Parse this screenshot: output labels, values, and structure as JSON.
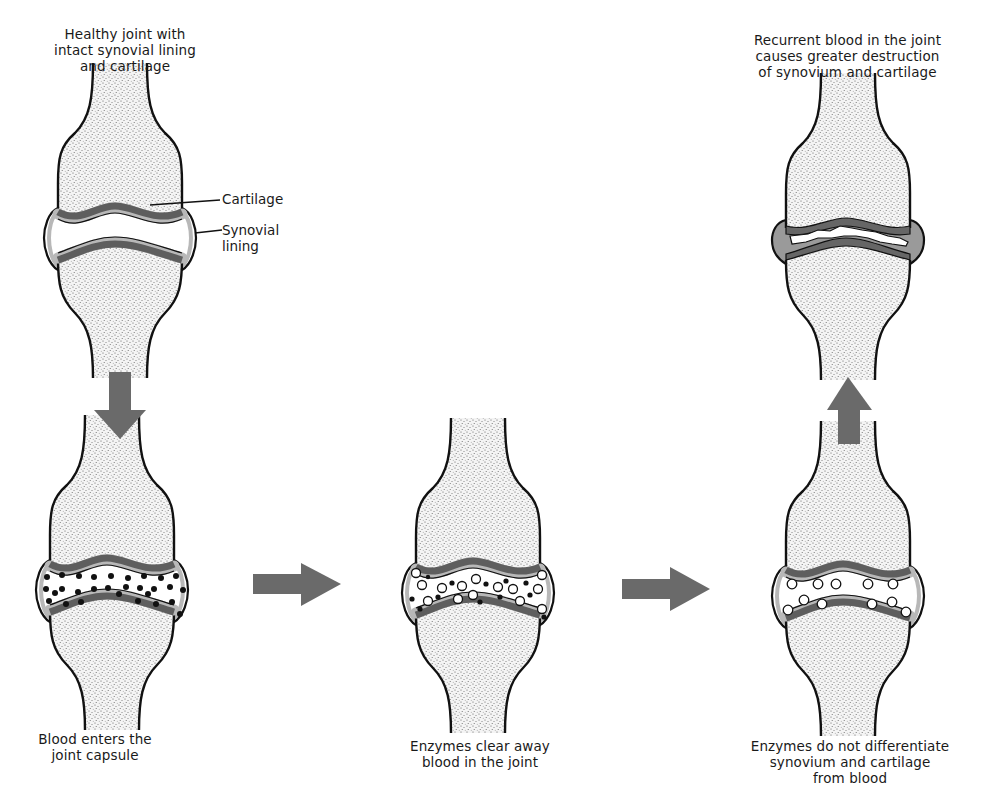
{
  "colors": {
    "bone_outline": "#111111",
    "bone_fill": "#f2f2f2",
    "stipple": "#555555",
    "cartilage": "#6e6e6e",
    "synovial": "#b8b8b8",
    "arrow": "#6a6a6a",
    "blood": "#111111"
  },
  "panels": [
    {
      "id": "healthy",
      "caption_lines": [
        "Healthy joint with",
        "intact synovial lining",
        "and cartilage"
      ],
      "labels": [
        {
          "text": "Cartilage"
        },
        {
          "lines": [
            "Synovial",
            "lining"
          ]
        }
      ]
    },
    {
      "id": "blood-enters",
      "caption_lines": [
        "Blood enters the",
        "joint capsule"
      ]
    },
    {
      "id": "enzymes-clear",
      "caption_lines": [
        "Enzymes clear away",
        "blood in the joint"
      ]
    },
    {
      "id": "enzymes-no-differentiate",
      "caption_lines": [
        "Enzymes do not differentiate",
        "synovium and cartilage",
        "from blood"
      ]
    },
    {
      "id": "recurrent",
      "caption_lines": [
        "Recurrent blood in the joint",
        "causes greater destruction",
        "of synovium and cartilage"
      ]
    }
  ],
  "arrows": [
    {
      "from": "healthy",
      "to": "blood-enters",
      "direction": "down"
    },
    {
      "from": "blood-enters",
      "to": "enzymes-clear",
      "direction": "right"
    },
    {
      "from": "enzymes-clear",
      "to": "enzymes-no-differentiate",
      "direction": "right"
    },
    {
      "from": "enzymes-no-differentiate",
      "to": "recurrent",
      "direction": "up"
    }
  ]
}
